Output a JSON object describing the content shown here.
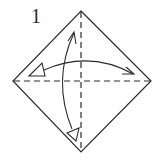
{
  "diagram": {
    "step_number": "1",
    "paper_outline": {
      "shape": "diamond",
      "top": [
        81,
        11
      ],
      "right": [
        151,
        81
      ],
      "bottom": [
        81,
        152
      ],
      "left": [
        13,
        81
      ]
    },
    "crease_lines": [
      {
        "name": "horizontal-valley-fold",
        "style": "dashed",
        "from": [
          13,
          81
        ],
        "to": [
          151,
          81
        ]
      },
      {
        "name": "vertical-valley-fold",
        "style": "dashed",
        "from": [
          81,
          11
        ],
        "to": [
          81,
          152
        ]
      }
    ],
    "arrows": [
      {
        "name": "fold-and-unfold-horizontal",
        "type": "fold-unfold",
        "from": "left",
        "to": "right"
      },
      {
        "name": "fold-and-unfold-vertical",
        "type": "fold-unfold",
        "from": "top",
        "to": "bottom"
      }
    ],
    "colors": {
      "line": "#2a2a2a",
      "background": "#ffffff"
    }
  }
}
